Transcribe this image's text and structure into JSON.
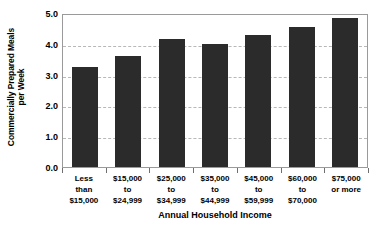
{
  "chart_data": {
    "type": "bar",
    "title": "",
    "xlabel": "Annual Household Income",
    "ylabel_line1": "Commercially Prepared Meals",
    "ylabel_line2": "per Week",
    "categories": [
      "Less\nthan\n$15,000",
      "$15,000\nto\n$24,999",
      "$25,000\nto\n$34,999",
      "$35,000\nto\n$44,999",
      "$45,000\nto\n$59,999",
      "$60,000\nto\n$70,000",
      "$75,000\nor more"
    ],
    "category_lines": [
      [
        "Less",
        "than",
        "$15,000"
      ],
      [
        "$15,000",
        "to",
        "$24,999"
      ],
      [
        "$25,000",
        "to",
        "$34,999"
      ],
      [
        "$35,000",
        "to",
        "$44,999"
      ],
      [
        "$45,000",
        "to",
        "$59,999"
      ],
      [
        "$60,000",
        "to",
        "$70,000"
      ],
      [
        "$75,000",
        "or more"
      ]
    ],
    "values": [
      3.25,
      3.6,
      4.15,
      4.0,
      4.3,
      4.55,
      4.85
    ],
    "ylim": [
      0.0,
      5.0
    ],
    "yticks": [
      0.0,
      1.0,
      2.0,
      3.0,
      4.0,
      5.0
    ],
    "ytick_labels": [
      "0.0",
      "1.0",
      "2.0",
      "3.0",
      "4.0",
      "5.0"
    ],
    "grid": true,
    "gridlines_at": [
      1.0,
      2.0,
      3.0,
      4.0
    ],
    "legend": null,
    "bar_color": "#2b2b2b",
    "grid_color": "#b8b8b8",
    "frame_color": "#9a9a9a",
    "background": "#ffffff"
  }
}
